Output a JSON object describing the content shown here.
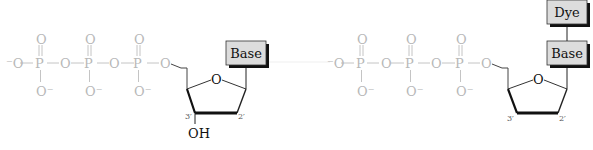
{
  "diagram": {
    "type": "chemical-structure",
    "molecules": [
      {
        "name": "dNTP",
        "phosphate_chain": {
          "terminal_oxygen": "⁻O",
          "phosphorus": [
            "P",
            "P",
            "P"
          ],
          "bridge_oxygens": [
            "O",
            "O",
            "O"
          ],
          "double_bond_oxygens": [
            "O",
            "O",
            "O"
          ],
          "charged_oxygens": [
            "O⁻",
            "O⁻",
            "O⁻"
          ]
        },
        "ring": {
          "ring_oxygen": "O",
          "carbon_labels": {
            "c3": "3′",
            "c2": "2′"
          },
          "substituent_3": "OH"
        },
        "boxes": [
          {
            "label": "Base"
          }
        ]
      },
      {
        "name": "dye-labeled ddNTP",
        "phosphate_chain": {
          "terminal_oxygen": "⁻O",
          "phosphorus": [
            "P",
            "P",
            "P"
          ],
          "bridge_oxygens": [
            "O",
            "O",
            "O"
          ],
          "double_bond_oxygens": [
            "O",
            "O",
            "O"
          ],
          "charged_oxygens": [
            "O⁻",
            "O⁻",
            "O⁻"
          ]
        },
        "ring": {
          "ring_oxygen": "O",
          "carbon_labels": {
            "c3": "3′",
            "c2": "2′"
          }
        },
        "boxes": [
          {
            "label": "Base"
          },
          {
            "label": "Dye"
          }
        ]
      }
    ],
    "colors": {
      "phosphate_text": "#b8b8b8",
      "box_fill": "#dcdcdc",
      "box_shadow": "#111111",
      "bond_dark": "#111111"
    }
  }
}
